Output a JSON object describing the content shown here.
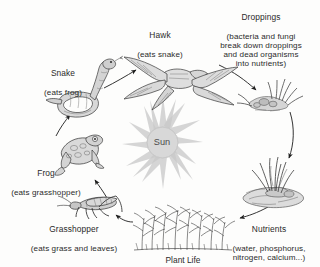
{
  "diagram": {
    "background_color": "#fdfdfc",
    "ink_color": "#2b2b2b",
    "center": {
      "label": "Sun",
      "icon": "sun-icon",
      "fill_color": "#d6d6d6",
      "ray_color": "#cfcfcf",
      "ray_count": 16
    },
    "nodes": [
      {
        "id": "hawk",
        "icon": "hawk-icon",
        "title": "Hawk",
        "subtitle": "(eats snake)"
      },
      {
        "id": "droppings",
        "icon": "droppings-icon",
        "title": "Droppings",
        "subtitle": "(bacteria and fungi\nbreak down droppings\nand dead organisms\ninto nutrients)"
      },
      {
        "id": "nutrients",
        "icon": "nutrients-icon",
        "title": "Nutrients",
        "subtitle": "(water, phosphorus,\nnitrogen, calcium...)"
      },
      {
        "id": "plants",
        "icon": "plant-life-icon",
        "title": "Plant Life",
        "subtitle": ""
      },
      {
        "id": "grasshopper",
        "icon": "grasshopper-icon",
        "title": "Grasshopper",
        "subtitle": "(eats grass and leaves)"
      },
      {
        "id": "frog",
        "icon": "frog-icon",
        "title": "Frog",
        "subtitle": "(eats grasshopper)"
      },
      {
        "id": "snake",
        "icon": "snake-icon",
        "title": "Snake",
        "subtitle": "(eats frog)"
      }
    ],
    "arrows": [
      {
        "id": "plants-to-grasshopper",
        "from": "plants",
        "to": "grasshopper"
      },
      {
        "id": "grasshopper-to-frog",
        "from": "grasshopper",
        "to": "frog"
      },
      {
        "id": "frog-to-snake",
        "from": "frog",
        "to": "snake"
      },
      {
        "id": "snake-to-hawk",
        "from": "snake",
        "to": "hawk"
      },
      {
        "id": "hawk-to-droppings",
        "from": "hawk",
        "to": "droppings"
      },
      {
        "id": "droppings-to-nutrients",
        "from": "droppings",
        "to": "nutrients"
      },
      {
        "id": "nutrients-to-plants",
        "from": "nutrients",
        "to": "plants"
      }
    ]
  }
}
